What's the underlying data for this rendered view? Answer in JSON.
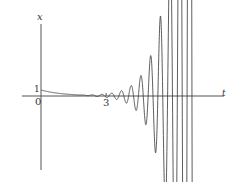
{
  "chart_data": {
    "type": "line",
    "title": "",
    "xlabel": "t",
    "ylabel": "x",
    "tick_labels": {
      "origin": "0",
      "x_tick": "3",
      "y_tick": "1"
    },
    "x_ticks": [
      3
    ],
    "y_ticks": [
      1
    ],
    "xlim": [
      -1.6,
      8.5
    ],
    "ylim": [
      -11,
      12.5
    ],
    "grid": false,
    "legend": null,
    "series": [
      {
        "name": "x(t)",
        "color": "#333333",
        "model": {
          "decay": 1.0,
          "osc_amp": 0.02,
          "growth": 1.52,
          "osc_start": 3.0,
          "omega": 14.0,
          "t_start": 0,
          "t_end": 7.1
        },
        "sample_points": [
          {
            "t": 0,
            "x": 1.0
          },
          {
            "t": 1,
            "x": 0.37
          },
          {
            "t": 2,
            "x": 0.14
          },
          {
            "t": 3,
            "x": 0.05
          },
          {
            "t": 4,
            "x": 0.1
          },
          {
            "t": 5,
            "x": 0.4
          },
          {
            "t": 6,
            "x": 1.9
          },
          {
            "t": 7,
            "x": 9.0
          }
        ]
      }
    ]
  },
  "layout": {
    "origin_px": [
      41,
      96
    ],
    "px_per_t": 21.7,
    "px_per_x": 6.0,
    "axis_color": "#555555",
    "curve_color": "#333333"
  }
}
